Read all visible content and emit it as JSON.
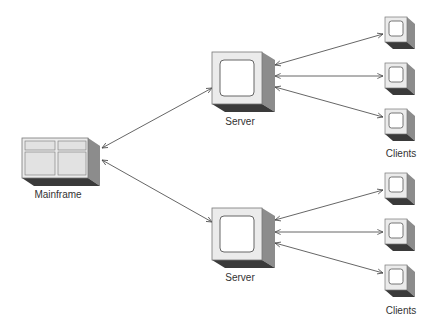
{
  "diagram": {
    "type": "network-topology",
    "nodes": {
      "mainframe": {
        "label": "Mainframe"
      },
      "server_top": {
        "label": "Server"
      },
      "server_bottom": {
        "label": "Server"
      },
      "clients_top_label": "Clients",
      "clients_bottom_label": "Clients"
    },
    "edges": [
      {
        "from": "mainframe",
        "to": "server_top",
        "bidirectional": true
      },
      {
        "from": "mainframe",
        "to": "server_bottom",
        "bidirectional": true
      },
      {
        "from": "server_top",
        "to": "client_1",
        "bidirectional": true
      },
      {
        "from": "server_top",
        "to": "client_2",
        "bidirectional": true
      },
      {
        "from": "server_top",
        "to": "client_3",
        "bidirectional": true
      },
      {
        "from": "server_bottom",
        "to": "client_4",
        "bidirectional": true
      },
      {
        "from": "server_bottom",
        "to": "client_5",
        "bidirectional": true
      },
      {
        "from": "server_bottom",
        "to": "client_6",
        "bidirectional": true
      }
    ],
    "colors": {
      "face": "#ebebeb",
      "side": "#8c8c8c",
      "bottom": "#3a3a3a",
      "line": "#444444"
    }
  }
}
